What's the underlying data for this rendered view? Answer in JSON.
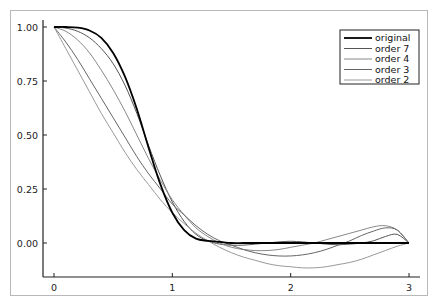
{
  "chart_data": {
    "type": "line",
    "title": "",
    "xlabel": "",
    "ylabel": "",
    "xlim": [
      -0.1,
      3.1
    ],
    "ylim": [
      -0.16,
      1.04
    ],
    "grid": false,
    "legend_position": "top-right",
    "x_ticks": [
      0,
      1,
      2,
      3
    ],
    "x_tick_labels": [
      "0",
      "1",
      "2",
      "3"
    ],
    "y_ticks": [
      0,
      0.25,
      0.5,
      0.75,
      1.0
    ],
    "y_tick_labels": [
      "0.00",
      "0.25",
      "0.50",
      "0.75",
      "1.00"
    ],
    "x": [
      0,
      0.1,
      0.2,
      0.3,
      0.4,
      0.5,
      0.6,
      0.7,
      0.8,
      0.9,
      1.0,
      1.1,
      1.2,
      1.3,
      1.4,
      1.5,
      1.6,
      1.7,
      1.8,
      1.9,
      2.0,
      2.1,
      2.2,
      2.3,
      2.4,
      2.5,
      2.6,
      2.7,
      2.8,
      2.9,
      3.0
    ],
    "series": [
      {
        "name": "original",
        "color": "#000000",
        "width": 1.8,
        "values": [
          1.0,
          1.0,
          0.997,
          0.984,
          0.95,
          0.88,
          0.77,
          0.62,
          0.44,
          0.27,
          0.14,
          0.06,
          0.02,
          0.01,
          0.005,
          0.0,
          0.0,
          0.0,
          0.0,
          0.0,
          0.0,
          0.0,
          0.0,
          0.0,
          0.0,
          0.0,
          0.0,
          0.0,
          0.0,
          0.0,
          0.0
        ]
      },
      {
        "name": "order 7",
        "color": "#555555",
        "width": 1.0,
        "values": [
          1.0,
          0.995,
          0.98,
          0.95,
          0.9,
          0.83,
          0.73,
          0.6,
          0.45,
          0.31,
          0.19,
          0.1,
          0.04,
          0.01,
          -0.005,
          -0.01,
          -0.01,
          -0.005,
          0.0,
          0.005,
          0.008,
          0.005,
          0.0,
          -0.005,
          -0.008,
          -0.005,
          0.0,
          0.01,
          0.03,
          0.04,
          0.0
        ]
      },
      {
        "name": "order 4",
        "color": "#888888",
        "width": 1.0,
        "values": [
          1.0,
          0.98,
          0.94,
          0.88,
          0.8,
          0.71,
          0.61,
          0.5,
          0.39,
          0.29,
          0.2,
          0.13,
          0.07,
          0.03,
          0.0,
          -0.02,
          -0.03,
          -0.035,
          -0.035,
          -0.03,
          -0.02,
          -0.01,
          0.0,
          0.015,
          0.03,
          0.045,
          0.06,
          0.075,
          0.08,
          0.06,
          0.0
        ]
      },
      {
        "name": "order 3",
        "color": "#666666",
        "width": 1.0,
        "values": [
          1.0,
          0.93,
          0.85,
          0.76,
          0.67,
          0.58,
          0.49,
          0.4,
          0.32,
          0.25,
          0.18,
          0.13,
          0.08,
          0.04,
          0.01,
          -0.01,
          -0.03,
          -0.045,
          -0.055,
          -0.06,
          -0.06,
          -0.055,
          -0.045,
          -0.03,
          -0.01,
          0.01,
          0.035,
          0.055,
          0.07,
          0.06,
          0.0
        ]
      },
      {
        "name": "order 2",
        "color": "#999999",
        "width": 1.0,
        "values": [
          1.0,
          0.9,
          0.8,
          0.7,
          0.6,
          0.51,
          0.42,
          0.34,
          0.27,
          0.2,
          0.14,
          0.09,
          0.045,
          0.01,
          -0.02,
          -0.045,
          -0.065,
          -0.08,
          -0.095,
          -0.105,
          -0.11,
          -0.115,
          -0.115,
          -0.11,
          -0.1,
          -0.09,
          -0.075,
          -0.055,
          -0.035,
          -0.015,
          0.0
        ]
      }
    ]
  },
  "legend": {
    "entries": [
      "original",
      "order 7",
      "order 4",
      "order 3",
      "order 2"
    ]
  }
}
